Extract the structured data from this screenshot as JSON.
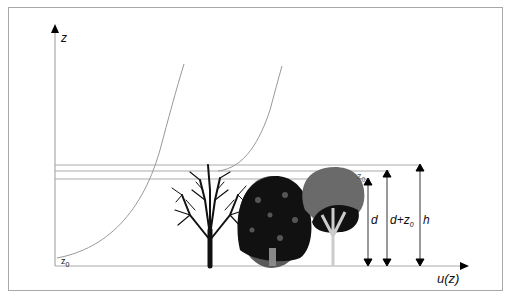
{
  "diagram": {
    "axes": {
      "y_label": "z",
      "x_label": "u(z)"
    },
    "labels": {
      "z0_bottom": "z",
      "z0_bottom_sub": "0",
      "z0_top": "z",
      "z0_top_sub": "0",
      "d": "d",
      "d_plus_z0": "d+z",
      "d_plus_z0_sub": "0",
      "h": "h"
    },
    "elements": [
      "bare deciduous tree",
      "dense broadleaf tree",
      "grey-crowned tree",
      "wind profile curve over bare ground",
      "displaced wind profile curve over canopy",
      "reference lines at d, d+z0, h"
    ],
    "colors": {
      "line": "#999999",
      "tree_dark": "#111111",
      "tree_grey": "#6a6a6a",
      "arrow": "#000000"
    }
  }
}
